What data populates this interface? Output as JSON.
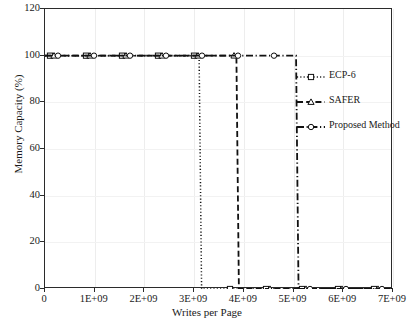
{
  "chart_data": {
    "type": "line",
    "title": "",
    "xlabel": "Writes per Page",
    "ylabel": "Memory Capacity (%)",
    "xlim": [
      0,
      7000000000
    ],
    "ylim": [
      0,
      120
    ],
    "grid": true,
    "legend_position": "inside-right",
    "x_ticks": [
      {
        "value": 0,
        "label": "0"
      },
      {
        "value": 1000000000,
        "label": "1E+09"
      },
      {
        "value": 2000000000,
        "label": "2E+09"
      },
      {
        "value": 3000000000,
        "label": "3E+09"
      },
      {
        "value": 4000000000,
        "label": "4E+09"
      },
      {
        "value": 5000000000,
        "label": "5E+09"
      },
      {
        "value": 6000000000,
        "label": "6E+09"
      },
      {
        "value": 7000000000,
        "label": "7E+09"
      }
    ],
    "y_ticks": [
      {
        "value": 0,
        "label": "0"
      },
      {
        "value": 20,
        "label": "20"
      },
      {
        "value": 40,
        "label": "40"
      },
      {
        "value": 60,
        "label": "60"
      },
      {
        "value": 80,
        "label": "80"
      },
      {
        "value": 100,
        "label": "100"
      },
      {
        "value": 120,
        "label": "120"
      }
    ],
    "series": [
      {
        "name": "ECP-6",
        "marker": "square",
        "dash": "dotted",
        "color": "#111111",
        "drop_x": 3150000000,
        "points": [
          {
            "x": 0,
            "y": 100
          },
          {
            "x": 3100000000,
            "y": 100
          },
          {
            "x": 3150000000,
            "y": 0
          },
          {
            "x": 7000000000,
            "y": 0
          }
        ]
      },
      {
        "name": "SAFER",
        "marker": "triangle",
        "dash": "dashed",
        "color": "#111111",
        "drop_x": 3900000000,
        "points": [
          {
            "x": 0,
            "y": 100
          },
          {
            "x": 3850000000,
            "y": 100
          },
          {
            "x": 3900000000,
            "y": 0
          },
          {
            "x": 7000000000,
            "y": 0
          }
        ]
      },
      {
        "name": "Proposed Method",
        "marker": "circle",
        "dash": "dash-dot",
        "color": "#111111",
        "drop_x": 5100000000,
        "points": [
          {
            "x": 0,
            "y": 100
          },
          {
            "x": 5050000000,
            "y": 100
          },
          {
            "x": 5100000000,
            "y": 0
          },
          {
            "x": 7000000000,
            "y": 0
          }
        ]
      }
    ]
  },
  "legend": {
    "items": [
      {
        "label": "ECP-6"
      },
      {
        "label": "SAFER"
      },
      {
        "label": "Proposed Method"
      }
    ]
  },
  "axes": {
    "x_title": "Writes per Page",
    "y_title": "Memory Capacity (%)"
  }
}
